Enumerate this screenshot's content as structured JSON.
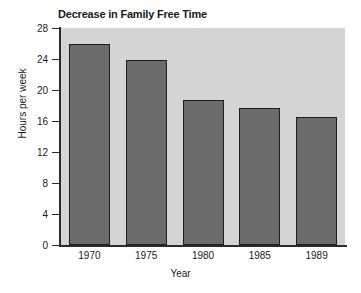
{
  "chart_data": {
    "type": "bar",
    "title": "Decrease in Family Free Time",
    "xlabel": "Year",
    "ylabel": "Hours per week",
    "categories": [
      "1970",
      "1975",
      "1980",
      "1985",
      "1989"
    ],
    "values": [
      26,
      23.9,
      18.7,
      17.7,
      16.5
    ],
    "ylim": [
      0,
      28
    ],
    "yticks": [
      0,
      4,
      8,
      12,
      16,
      20,
      24,
      28
    ],
    "ytick_labels": [
      "0",
      "4",
      "8",
      "12",
      "16",
      "20",
      "24",
      "28"
    ],
    "grid": false,
    "legend": null,
    "series": [
      {
        "name": "Hours per week",
        "values": [
          26,
          23.9,
          18.7,
          17.7,
          16.5
        ]
      }
    ],
    "colors": {
      "bar_fill": "#6c6c6c",
      "bar_outline": "#1c1c1c",
      "plot_background": "#d4d4d4",
      "page_background": "#ffffff",
      "axis": "#2b2b2b",
      "text": "#1a1a1a"
    }
  }
}
